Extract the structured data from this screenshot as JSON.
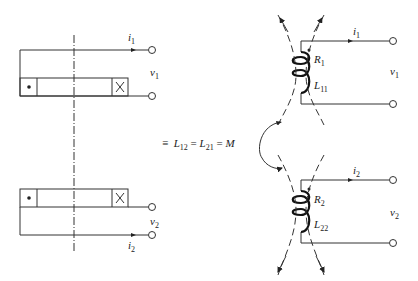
{
  "figure": {
    "left_diagram": {
      "coil1": {
        "current": "i",
        "current_sub": "1",
        "voltage": "v",
        "voltage_sub": "1",
        "dot_marker": "•",
        "cross_marker": "×"
      },
      "coil2": {
        "current": "i",
        "current_sub": "2",
        "voltage": "v",
        "voltage_sub": "2",
        "dot_marker": "•",
        "cross_marker": "×"
      }
    },
    "equivalence": {
      "symbol": "≡",
      "L12": "L",
      "L12_sub": "12",
      "L21": "L",
      "L21_sub": "21",
      "M": "M",
      "eq": "="
    },
    "right_diagram": {
      "coil1": {
        "current": "i",
        "current_sub": "1",
        "voltage": "v",
        "voltage_sub": "1",
        "R": "R",
        "R_sub": "1",
        "L": "L",
        "L_sub": "11"
      },
      "coil2": {
        "current": "i",
        "current_sub": "2",
        "voltage": "v",
        "voltage_sub": "2",
        "R": "R",
        "R_sub": "2",
        "L": "L",
        "L_sub": "22"
      }
    }
  }
}
